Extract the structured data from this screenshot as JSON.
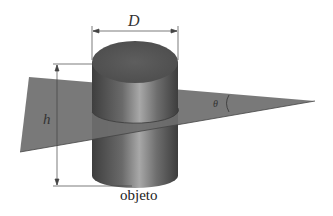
{
  "diagram": {
    "labels": {
      "diameter": "D",
      "height": "h",
      "angle": "θ",
      "object": "objeto"
    },
    "colors": {
      "plane": "#6e6e6e",
      "cylinder_top": "#5a5a5a",
      "cylinder_side_dark": "#4a4a4a",
      "cylinder_side_light": "#9a9a9a",
      "dimension_lines": "#444444",
      "background": "#ffffff"
    }
  }
}
